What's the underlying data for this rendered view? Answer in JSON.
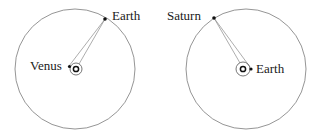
{
  "diagrams": [
    {
      "name": "venus-earth",
      "outer_orbit_label": "Earth",
      "inner_planet_label": "Venus"
    },
    {
      "name": "earth-saturn",
      "outer_orbit_label": "Saturn",
      "inner_planet_label": "Earth"
    }
  ],
  "colors": {
    "orbit": "#7a7a7a",
    "sightline": "#8a8a8a",
    "planet": "#111111",
    "text": "#1a1a1a"
  }
}
